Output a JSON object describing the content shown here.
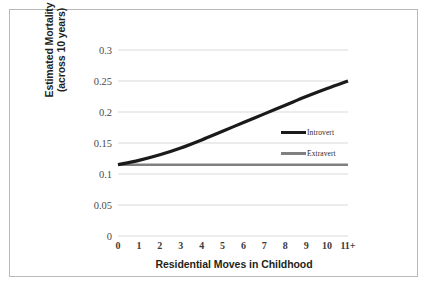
{
  "chart_data": {
    "type": "line",
    "title": "",
    "xlabel": "Residential Moves in Childhood",
    "ylabel": "Estimated Mortality (across 10 years)",
    "ylabel_line1": "Estimated Mortality",
    "ylabel_line2": "(across 10 years)",
    "categories": [
      "0",
      "1",
      "2",
      "3",
      "4",
      "5",
      "6",
      "7",
      "8",
      "9",
      "10",
      "11+"
    ],
    "x": [
      0,
      1,
      2,
      3,
      4,
      5,
      6,
      7,
      8,
      9,
      10,
      11
    ],
    "ylim": [
      0,
      0.3
    ],
    "yticks": [
      0,
      0.05,
      0.1,
      0.15,
      0.2,
      0.25,
      0.3
    ],
    "ytick_labels": [
      "0",
      "0.05",
      "0.1",
      "0.15",
      "0.2",
      "0.25",
      "0.3"
    ],
    "grid": "horizontal",
    "legend_position": "inside-right",
    "series": [
      {
        "name": "Introvert",
        "color": "#1a1a1a",
        "values": [
          0.115,
          0.122,
          0.131,
          0.142,
          0.155,
          0.169,
          0.183,
          0.197,
          0.211,
          0.225,
          0.238,
          0.25
        ]
      },
      {
        "name": "Extravert",
        "color": "#808080",
        "values": [
          0.115,
          0.115,
          0.115,
          0.115,
          0.115,
          0.115,
          0.115,
          0.115,
          0.115,
          0.115,
          0.115,
          0.115
        ]
      }
    ]
  },
  "axes": {
    "y_tick_labels": [
      "0.3",
      "0.25",
      "0.2",
      "0.15",
      "0.1",
      "0.05",
      "0"
    ],
    "x_tick_labels": [
      "0",
      "1",
      "2",
      "3",
      "4",
      "5",
      "6",
      "7",
      "8",
      "9",
      "10",
      "11+"
    ]
  },
  "legend": {
    "items": [
      {
        "label": "Introvert",
        "color": "#1a1a1a"
      },
      {
        "label": "Extravert",
        "color": "#808080"
      }
    ]
  },
  "colors": {
    "introvert": "#1a1a1a",
    "extravert": "#808080",
    "gridline": "#d9d9d9",
    "frame": "#b9b9b9",
    "text": "#231f20"
  }
}
